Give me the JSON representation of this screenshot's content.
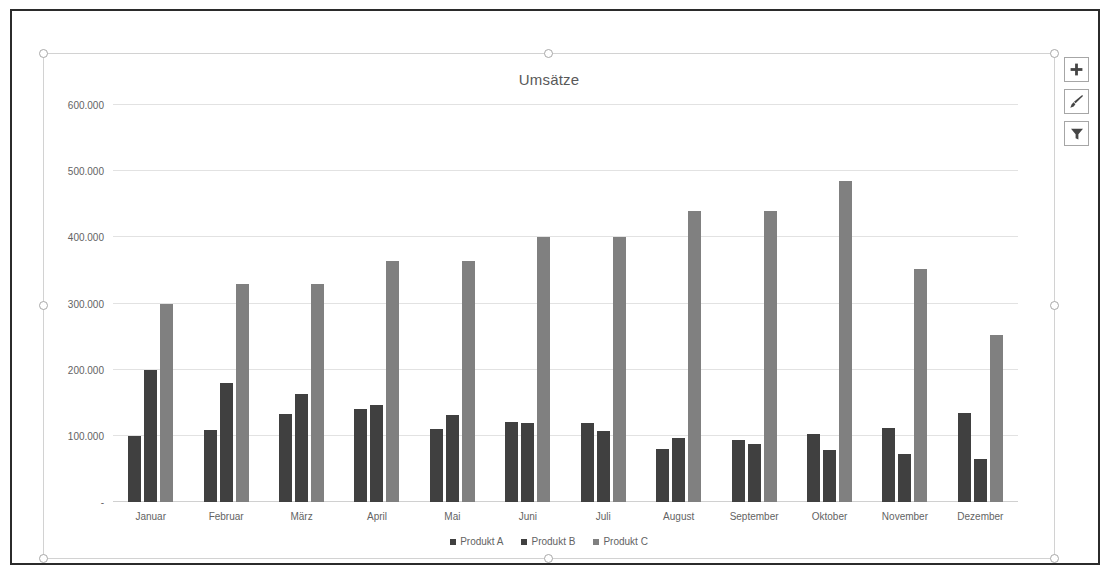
{
  "chart_data": {
    "type": "bar",
    "title": "Umsätze",
    "xlabel": "",
    "ylabel": "",
    "ylim": [
      0,
      600000
    ],
    "ytick_values": [
      0,
      100000,
      200000,
      300000,
      400000,
      500000,
      600000
    ],
    "ytick_labels": [
      "-",
      "100.000",
      "200.000",
      "300.000",
      "400.000",
      "500.000",
      "600.000"
    ],
    "grid": true,
    "legend_position": "bottom",
    "categories": [
      "Januar",
      "Februar",
      "März",
      "April",
      "Mai",
      "Juni",
      "Juli",
      "August",
      "September",
      "Oktober",
      "November",
      "Dezember"
    ],
    "series": [
      {
        "name": "Produkt A",
        "color": "#404040",
        "values": [
          100000,
          109000,
          133000,
          140000,
          111000,
          121000,
          120000,
          80000,
          94000,
          103000,
          112000,
          134000
        ]
      },
      {
        "name": "Produkt B",
        "color": "#404040",
        "values": [
          200000,
          180000,
          163000,
          146000,
          132000,
          120000,
          107000,
          96000,
          88000,
          79000,
          72000,
          65000
        ]
      },
      {
        "name": "Produkt C",
        "color": "#808080",
        "values": [
          300000,
          330000,
          330000,
          365000,
          365000,
          400000,
          400000,
          440000,
          440000,
          485000,
          352000,
          252000
        ]
      }
    ]
  },
  "chart_buttons": [
    {
      "name": "chart-elements-button",
      "icon": "plus-icon",
      "label": "+"
    },
    {
      "name": "chart-styles-button",
      "icon": "brush-icon",
      "label": ""
    },
    {
      "name": "chart-filters-button",
      "icon": "funnel-icon",
      "label": ""
    }
  ],
  "colors": {
    "title_text": "#595959",
    "axis_text": "#636363",
    "gridline": "#e2e2e2",
    "selection_frame": "#d2d2d2",
    "window_border": "#2b2b2b"
  }
}
